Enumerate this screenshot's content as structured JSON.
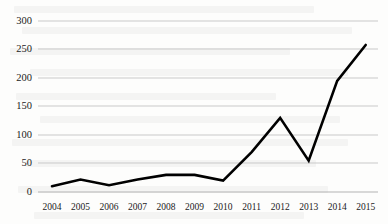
{
  "chart_data": {
    "type": "line",
    "title": "",
    "xlabel": "",
    "ylabel": "",
    "categories": [
      "2004",
      "2005",
      "2006",
      "2007",
      "2008",
      "2009",
      "2010",
      "2011",
      "2012",
      "2013",
      "2014",
      "2015"
    ],
    "values": [
      10,
      22,
      12,
      22,
      30,
      30,
      20,
      70,
      130,
      55,
      195,
      258
    ],
    "series": [
      {
        "name": "",
        "values": [
          10,
          22,
          12,
          22,
          30,
          30,
          20,
          70,
          130,
          55,
          195,
          258
        ]
      }
    ],
    "ylim": [
      0,
      300
    ],
    "yticks": [
      0,
      50,
      100,
      150,
      200,
      250,
      300
    ],
    "ytick_labels": [
      "0",
      "50",
      "100",
      "150",
      "200",
      "250",
      "300"
    ],
    "grid": true,
    "grid_axis": "y",
    "legend": false,
    "legend_position": "none",
    "markers": false,
    "line_color": "#000000",
    "line_width": 2.6,
    "grid_color": "#c9c9c9",
    "axis_color": "#b3b3b3",
    "background_color": "#ffffff",
    "text_color": "#1b1b1b"
  },
  "figure": {
    "width": 388,
    "height": 224
  }
}
